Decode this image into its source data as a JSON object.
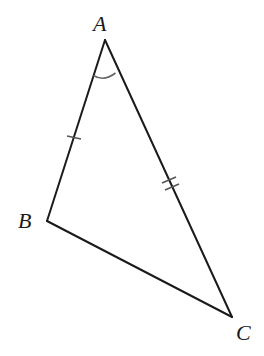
{
  "diagram": {
    "type": "triangle",
    "vertices": {
      "A": {
        "label": "A",
        "x": 105,
        "y": 40
      },
      "B": {
        "label": "B",
        "x": 47,
        "y": 221
      },
      "C": {
        "label": "C",
        "x": 232,
        "y": 317
      }
    },
    "labels": {
      "A": "A",
      "B": "B",
      "C": "C"
    },
    "markings": {
      "side_AB": {
        "tick_count": 1,
        "meaning": "congruent-side-mark"
      },
      "side_AC": {
        "tick_count": 2,
        "meaning": "congruent-side-mark"
      },
      "angle_A": {
        "arc_count": 1,
        "meaning": "angle-mark"
      }
    },
    "colors": {
      "stroke": "#1a1a1a",
      "marks": "#666666",
      "background": "#ffffff"
    }
  }
}
